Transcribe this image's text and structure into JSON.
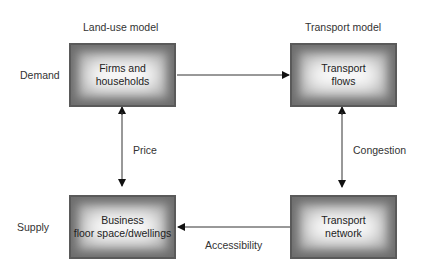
{
  "headers": {
    "land_use": "Land-use model",
    "transport": "Transport model"
  },
  "rows": {
    "demand": "Demand",
    "supply": "Supply"
  },
  "boxes": {
    "firms": "Firms and\nhouseholds",
    "flows": "Transport\nflows",
    "floorspace": "Business\nfloor space/dwellings",
    "network": "Transport\nnetwork"
  },
  "links": {
    "price": "Price",
    "congestion": "Congestion",
    "accessibility": "Accessibility"
  }
}
